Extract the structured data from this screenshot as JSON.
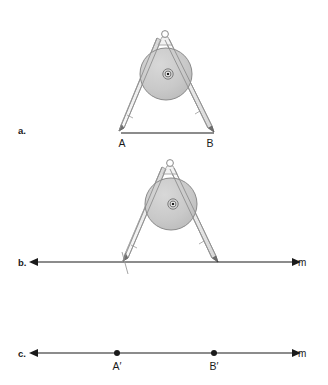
{
  "figure": {
    "background_color": "#ffffff",
    "ink_color": "#1a1a1a",
    "disc_fill": "#c9c9c9",
    "disc_stroke": "#8a8a8a",
    "leg_fill": "#f2f2f2",
    "leg_stroke": "#9a9a9a"
  },
  "panels": [
    {
      "key": "a",
      "label": "a.",
      "label_x": 18,
      "label_y": 134,
      "caption": "Compass set to the width of segment AB",
      "segment": {
        "name": "segment-ab",
        "x1": 121,
        "x2": 214,
        "y": 133,
        "endpoints": [
          {
            "name": "point-a",
            "label": "A",
            "x": 121,
            "label_x": 122,
            "label_y": 147
          },
          {
            "name": "point-b",
            "label": "B",
            "x": 214,
            "label_x": 210,
            "label_y": 147
          }
        ]
      },
      "compass": {
        "name": "compass",
        "pivot_x": 165,
        "pivot_y": 34,
        "disc_cx": 166,
        "disc_cy": 74,
        "disc_r": 26,
        "hub_cx": 168,
        "hub_cy": 74,
        "left_tip_x": 121,
        "left_tip_y": 132,
        "right_tip_x": 214,
        "right_tip_y": 132
      }
    },
    {
      "key": "b",
      "label": "b.",
      "label_x": 18,
      "label_y": 266,
      "caption": "Compass transferred to line m",
      "line": {
        "name": "line-m-b",
        "label": "m",
        "x1": 38,
        "x2": 292,
        "y": 262,
        "label_x": 298,
        "label_y": 266,
        "arrows": "both"
      },
      "tick_marks": [
        {
          "name": "arc-tick-left",
          "x": 125,
          "y": 262
        }
      ],
      "compass": {
        "name": "compass",
        "pivot_x": 170,
        "pivot_y": 163,
        "disc_cx": 171,
        "disc_cy": 204,
        "disc_r": 26,
        "hub_cx": 173,
        "hub_cy": 204,
        "left_tip_x": 125,
        "left_tip_y": 262,
        "right_tip_x": 218,
        "right_tip_y": 262
      }
    },
    {
      "key": "c",
      "label": "c.",
      "label_x": 18,
      "label_y": 357,
      "caption": "Copied segment A prime B prime on line m",
      "line": {
        "name": "line-m-c",
        "label": "m",
        "x1": 38,
        "x2": 292,
        "y": 353,
        "label_x": 298,
        "label_y": 357,
        "arrows": "both"
      },
      "points": [
        {
          "name": "point-a-prime",
          "label": "A′",
          "x": 117,
          "y": 353,
          "label_x": 112,
          "label_y": 370
        },
        {
          "name": "point-b-prime",
          "label": "B′",
          "x": 214,
          "y": 353,
          "label_x": 209,
          "label_y": 370
        }
      ]
    }
  ]
}
